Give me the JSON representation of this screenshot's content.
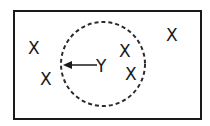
{
  "diagram": {
    "frame": {
      "x": 14,
      "y": 11,
      "width": 187,
      "height": 108,
      "stroke": "#1a1a1a"
    },
    "circle": {
      "cx": 103,
      "cy": 64,
      "r": 42,
      "style": "dashed",
      "stroke": "#2a2a2a"
    },
    "center_label": {
      "text": "Y",
      "x": 103,
      "y": 72
    },
    "arrow": {
      "from": [
        97,
        65
      ],
      "to": [
        62,
        65
      ],
      "label": "radius arrow"
    },
    "points": [
      {
        "text": "X",
        "x": 34,
        "y": 54
      },
      {
        "text": "X",
        "x": 46,
        "y": 85
      },
      {
        "text": "X",
        "x": 126,
        "y": 57
      },
      {
        "text": "X",
        "x": 131,
        "y": 80
      },
      {
        "text": "X",
        "x": 172,
        "y": 41
      }
    ]
  }
}
